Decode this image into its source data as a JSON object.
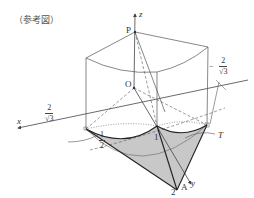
{
  "figure": {
    "caption": "（参考図）",
    "labels": {
      "z_axis": "z",
      "x_axis": "x",
      "y_axis": "y",
      "point_P": "P",
      "point_O": "O",
      "point_A": "A",
      "region_T": "T",
      "tick_one": "1",
      "tick_two": "2"
    },
    "fractions": {
      "left_two_over_root3": {
        "numerator": "2",
        "denominator": "√3"
      },
      "right_neg_two_over_root3": {
        "sign": "−",
        "numerator": "2",
        "denominator": "√3"
      },
      "one_half": {
        "numerator": "1",
        "denominator": "2"
      }
    },
    "colors": {
      "line": "#444444",
      "shade": "#c8c8c8",
      "text": "#333333"
    }
  }
}
